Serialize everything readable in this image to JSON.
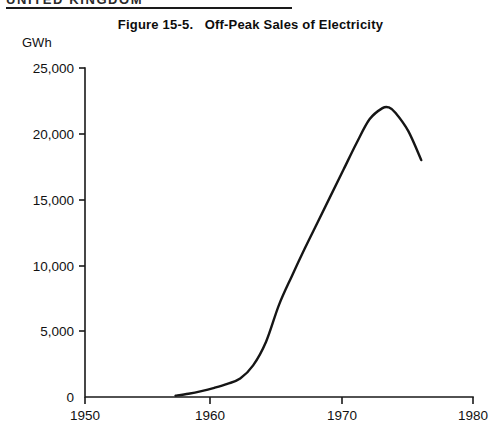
{
  "page": {
    "running_head": "UNITED KINGDOM"
  },
  "figure": {
    "number_label": "Figure 15-5.",
    "title": "Figure 15-5.   Off-Peak Sales of Electricity",
    "caption_text": "Off-Peak Sales of Electricity",
    "unit_label": "GWh"
  },
  "colors": {
    "line": "#151515",
    "axis": "#1a1a1a",
    "text": "#111111",
    "background": "#ffffff"
  },
  "axis": {
    "y_ticks": [
      "0",
      "5,000",
      "10,000",
      "15,000",
      "20,000",
      "25,000"
    ],
    "x_ticks": [
      "1950",
      "1960",
      "1970",
      "1980"
    ]
  },
  "chart_data": {
    "type": "line",
    "title": "Figure 15-5.   Off-Peak Sales of Electricity",
    "subtitle": "",
    "xlabel": "",
    "ylabel": "GWh",
    "xlim": [
      1950,
      1980
    ],
    "ylim": [
      0,
      25000
    ],
    "xticks": [
      1950,
      1960,
      1970,
      1980
    ],
    "yticks": [
      0,
      5000,
      10000,
      15000,
      20000,
      25000
    ],
    "ytick_labels": [
      "0",
      "5,000",
      "10,000",
      "15,000",
      "20,000",
      "25,000"
    ],
    "xtick_labels": [
      "1950",
      "1960",
      "1970",
      "1980"
    ],
    "grid": false,
    "legend": false,
    "legend_position": "none",
    "series": [
      {
        "name": "Off-peak sales of electricity",
        "units": "GWh",
        "x": [
          1957,
          1958,
          1959,
          1960,
          1961,
          1962,
          1963,
          1964,
          1965,
          1966,
          1967,
          1968,
          1969,
          1970,
          1971,
          1972,
          1973,
          1973.5,
          1974,
          1975,
          1976
        ],
        "values": [
          100,
          250,
          450,
          700,
          1000,
          1400,
          2400,
          4200,
          7000,
          9200,
          11300,
          13300,
          15300,
          17300,
          19300,
          21100,
          21950,
          22000,
          21600,
          20200,
          18000
        ]
      }
    ]
  }
}
